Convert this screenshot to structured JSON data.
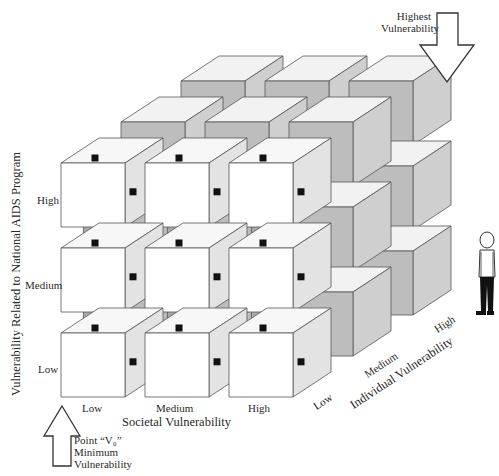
{
  "diagram": {
    "axes": {
      "x": {
        "title": "Societal Vulnerability",
        "levels": [
          "Low",
          "Medium",
          "High"
        ]
      },
      "y": {
        "title": "Vulnerability Related to National AIDS Program",
        "levels": [
          "Low",
          "Medium",
          "High"
        ]
      },
      "z": {
        "title": "Individual Vulnerability",
        "levels": [
          "Low",
          "Medium",
          "High"
        ]
      }
    },
    "annotations": {
      "highest": {
        "line1": "Highest",
        "line2": "Vulnerability"
      },
      "origin": {
        "line1": "Point “V₀”",
        "line2": "Minimum",
        "line3": "Vulnerability"
      }
    },
    "figure": {
      "label": "person-scale-figure"
    },
    "colors": {
      "front_face": "#ffffff",
      "side_face": "#e3e3e3",
      "top_face": "#f7f7f7",
      "back_front_face": "#bdbdbd",
      "back_side_face": "#cfcfcf",
      "back_top_face": "#f2f2f2",
      "connector": "#a9a9a9",
      "connector_dark": "#8f8f8f",
      "stroke": "#555555",
      "marker": "#111111"
    }
  }
}
